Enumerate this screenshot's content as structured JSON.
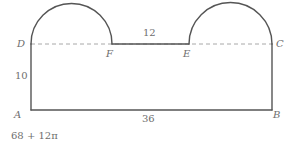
{
  "figure": {
    "stroke_color": "#555555",
    "dashed_color": "#a8a8a8",
    "text_color": "#6e6e6e",
    "background_color": "#ffffff"
  },
  "vertices": [
    {
      "id": "D",
      "label": "D",
      "x": 31,
      "y": 44
    },
    {
      "id": "C",
      "label": "C",
      "x": 272,
      "y": 44
    },
    {
      "id": "A",
      "label": "A",
      "x": 31,
      "y": 110
    },
    {
      "id": "B",
      "label": "B",
      "x": 272,
      "y": 110
    },
    {
      "id": "F",
      "label": "F",
      "x": 112,
      "y": 44
    },
    {
      "id": "E",
      "label": "E",
      "x": 189,
      "y": 44
    }
  ],
  "measurements": [
    {
      "id": "height",
      "label": "10",
      "describes": "AD left side length"
    },
    {
      "id": "top",
      "label": "12",
      "describes": "FE segment length"
    },
    {
      "id": "bottom",
      "label": "36",
      "describes": "AB base length"
    }
  ],
  "segments": [
    {
      "id": "left-side",
      "from": "D",
      "to": "A",
      "style": "solid"
    },
    {
      "id": "bottom-side",
      "from": "A",
      "to": "B",
      "style": "solid"
    },
    {
      "id": "right-side",
      "from": "B",
      "to": "C",
      "style": "solid"
    },
    {
      "id": "top-middle",
      "from": "F",
      "to": "E",
      "style": "solid"
    },
    {
      "id": "dashed-DC",
      "from": "D",
      "to": "C",
      "style": "dashed"
    }
  ],
  "arcs": [
    {
      "id": "left-semicircle",
      "from": "D",
      "to": "F",
      "diameter_px": 81
    },
    {
      "id": "right-semicircle",
      "from": "E",
      "to": "C",
      "diameter_px": 83
    }
  ],
  "answer": {
    "text": "68 + 12π"
  }
}
